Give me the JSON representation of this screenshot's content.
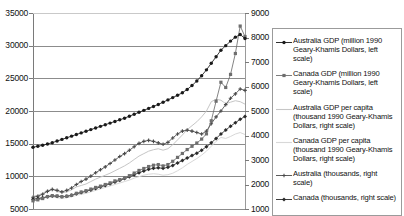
{
  "chart_data": {
    "type": "line",
    "title": "",
    "xlabel": "",
    "ylabel": "",
    "y2label": "",
    "grid": true,
    "legend_position": "right",
    "left_axis": {
      "ticks": [
        "35000",
        "30000",
        "25000",
        "20000",
        "15000",
        "10000",
        "5000"
      ],
      "min": 5000,
      "max": 35000,
      "step": 5000
    },
    "right_axis": {
      "ticks": [
        "9000",
        "8000",
        "7000",
        "6000",
        "5000",
        "4000",
        "3000",
        "2000",
        "1000"
      ],
      "min": 1000,
      "max": 9000,
      "step": 1000
    },
    "note": "x-axis tick labels are cropped out of the screenshot",
    "series": [
      {
        "name": "Australia GDP (million 1990 Geary-Khamis Dollars, left scale)",
        "axis": "left",
        "color": "#1a1a1a",
        "marker": "circle",
        "values": [
          14450,
          14600,
          14750,
          14950,
          15150,
          15400,
          15650,
          15900,
          16150,
          16400,
          16650,
          16900,
          17150,
          17400,
          17650,
          17900,
          18150,
          18400,
          18650,
          18900,
          19200,
          19500,
          19800,
          20100,
          20400,
          20700,
          21000,
          21350,
          21700,
          22050,
          22400,
          22800,
          23300,
          23900,
          24600,
          25400,
          26300,
          27300,
          28300,
          29300,
          30000,
          30700,
          31300,
          31700,
          31100
        ]
      },
      {
        "name": "Canada GDP (million 1990 Geary-Khamis Dollars, left scale)",
        "axis": "left",
        "color": "#6e6e6e",
        "marker": "square",
        "values": [
          6250,
          6400,
          6600,
          6900,
          7050,
          7000,
          6900,
          6950,
          7100,
          7400,
          7600,
          7800,
          8050,
          8300,
          8500,
          8750,
          9000,
          9300,
          9500,
          9750,
          10100,
          10500,
          10900,
          11200,
          11500,
          11700,
          11800,
          11600,
          11800,
          12300,
          12900,
          13500,
          14100,
          14600,
          15100,
          15700,
          16500,
          18500,
          21500,
          24400,
          23600,
          25600,
          28800,
          33000,
          31400
        ]
      },
      {
        "name": "Australia GDP per capita (thousand 1990 Geary-Khamis Dollars, right scale)",
        "axis": "right",
        "color": "#c6c6c6",
        "marker": "none",
        "values": [
          1520,
          1560,
          1640,
          1760,
          1800,
          1720,
          1660,
          1700,
          1780,
          1900,
          1960,
          2020,
          2120,
          2220,
          2300,
          2380,
          2460,
          2560,
          2660,
          2760,
          2880,
          3020,
          3160,
          3260,
          3360,
          3420,
          3460,
          3400,
          3460,
          3620,
          3820,
          4020,
          4240,
          4400,
          4560,
          4760,
          5000,
          5380,
          5480,
          5440,
          5300,
          5360,
          5420,
          5380,
          5280
        ]
      },
      {
        "name": "Canada GDP per capita (thousand 1990 Geary-Khamis Dollars, right scale)",
        "axis": "right",
        "color": "#d8d8d8",
        "marker": "none",
        "values": [
          1380,
          1400,
          1440,
          1480,
          1500,
          1460,
          1440,
          1460,
          1500,
          1560,
          1600,
          1640,
          1700,
          1760,
          1820,
          1880,
          1940,
          2000,
          2060,
          2120,
          2180,
          2260,
          2320,
          2380,
          2420,
          2440,
          2420,
          2380,
          2400,
          2460,
          2560,
          2680,
          2820,
          2940,
          3060,
          3200,
          3360,
          3560,
          3760,
          3920,
          3880,
          3960,
          4060,
          4120,
          4040
        ]
      },
      {
        "name": "Australia (thousands, right scale)",
        "axis": "right",
        "color": "#4a4a4a",
        "marker": "cross",
        "values": [
          1480,
          1520,
          1600,
          1720,
          1800,
          1760,
          1700,
          1760,
          1860,
          2000,
          2120,
          2220,
          2340,
          2480,
          2600,
          2720,
          2860,
          3000,
          3140,
          3260,
          3400,
          3540,
          3680,
          3760,
          3800,
          3760,
          3700,
          3640,
          3720,
          3900,
          4060,
          4180,
          4220,
          4180,
          4120,
          4060,
          4180,
          4480,
          4760,
          5000,
          5260,
          5520,
          5700,
          5900,
          5840
        ]
      },
      {
        "name": "Canada (thousands, right scale)",
        "axis": "right",
        "color": "#2a2a2a",
        "marker": "diamond",
        "values": [
          1400,
          1430,
          1460,
          1500,
          1530,
          1520,
          1500,
          1520,
          1560,
          1620,
          1670,
          1720,
          1780,
          1840,
          1900,
          1960,
          2030,
          2100,
          2170,
          2240,
          2320,
          2400,
          2480,
          2550,
          2620,
          2660,
          2680,
          2660,
          2700,
          2780,
          2880,
          2980,
          3080,
          3180,
          3280,
          3400,
          3540,
          3700,
          3880,
          4060,
          4220,
          4380,
          4520,
          4660,
          4780
        ]
      }
    ]
  },
  "legend": {
    "entries": [
      {
        "label": "Australia GDP (million 1990 Geary-Khamis Dollars, left scale)",
        "key": "line-circle-dark"
      },
      {
        "label": "Canada GDP (million 1990 Geary-Khamis Dollars, left scale)",
        "key": "line-square-gray"
      },
      {
        "label": "Australia GDP per capita (thousand 1990 Geary-Khamis Dollars, right scale)",
        "key": "line-plain-lightgray"
      },
      {
        "label": "Canada GDP per capita (thousand 1990 Geary-Khamis Dollars, right scale)",
        "key": "line-plain-lightergray"
      },
      {
        "label": "Australia (thousands, right scale)",
        "key": "line-cross-dark"
      },
      {
        "label": "Canada (thousands, right scale)",
        "key": "line-diamond-dark"
      }
    ]
  },
  "colors": {
    "australia_gdp": "#1a1a1a",
    "canada_gdp": "#6e6e6e",
    "australia_pc": "#c6c6c6",
    "canada_pc": "#d8d8d8",
    "australia_pop": "#4a4a4a",
    "canada_pop": "#2a2a2a",
    "grid": "#8c8c8c",
    "axis": "#7a7a7a"
  }
}
